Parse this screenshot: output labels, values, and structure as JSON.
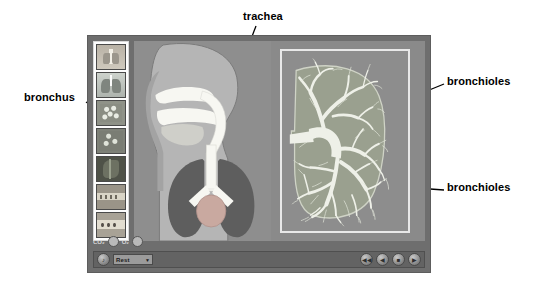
{
  "page": {
    "background_color": "#ffffff",
    "width": 539,
    "height": 284
  },
  "annotations": [
    {
      "id": "trachea",
      "label": "trachea",
      "position": "top-center",
      "target": "trachea in thorax diagram"
    },
    {
      "id": "bronchus",
      "label": "bronchus",
      "position": "left",
      "target": "left primary bronchus"
    },
    {
      "id": "bronchioles-1",
      "label": "bronchioles",
      "position": "right-upper",
      "target": "upper bronchial branches in lung cross-section"
    },
    {
      "id": "bronchioles-2",
      "label": "bronchioles",
      "position": "right-lower",
      "target": "lower bronchial branches in lung cross-section"
    }
  ],
  "app": {
    "window_color": "#6e6e6e",
    "thumbnails": [
      {
        "name": "thumbnail-torso-overview",
        "art": "t-torso"
      },
      {
        "name": "thumbnail-lungs",
        "art": "t-lungs"
      },
      {
        "name": "thumbnail-bronchial-tree",
        "art": "t-tree"
      },
      {
        "name": "thumbnail-bronchial-tree-detail",
        "art": "t-tree2"
      },
      {
        "name": "thumbnail-lung-tissue-dark",
        "art": "t-dark"
      },
      {
        "name": "thumbnail-alveoli-strip",
        "art": "t-strip"
      },
      {
        "name": "thumbnail-gas-exchange-strip",
        "art": "t-strip2"
      }
    ],
    "indicators": [
      {
        "label": "CO₂",
        "state": "on"
      },
      {
        "label": "O₂",
        "state": "on"
      }
    ],
    "transport": {
      "sound_button": "♪",
      "mode_value": "Rest",
      "mode_caret": "▼",
      "buttons": [
        {
          "name": "skip-back-button",
          "glyph": "◀◀"
        },
        {
          "name": "step-back-button",
          "glyph": "◀"
        },
        {
          "name": "stop-button",
          "glyph": "■"
        },
        {
          "name": "play-button",
          "glyph": "▶"
        }
      ]
    },
    "panels": {
      "left_panel_name": "sagittal-airway-diagram",
      "right_panel_name": "lung-cross-section-diagram"
    }
  },
  "colors": {
    "label_text": "#000000",
    "leader_line": "#000000",
    "viewport_bg": "#8e8e8e",
    "body_fill": "#b3b3b3",
    "airway_white": "#f7f7f2",
    "lung_dark": "#5e5e5e",
    "heart_pink": "#c9a9a0",
    "lung_tissue": "#9aa08f",
    "bronchial_white": "#eef0e8"
  }
}
